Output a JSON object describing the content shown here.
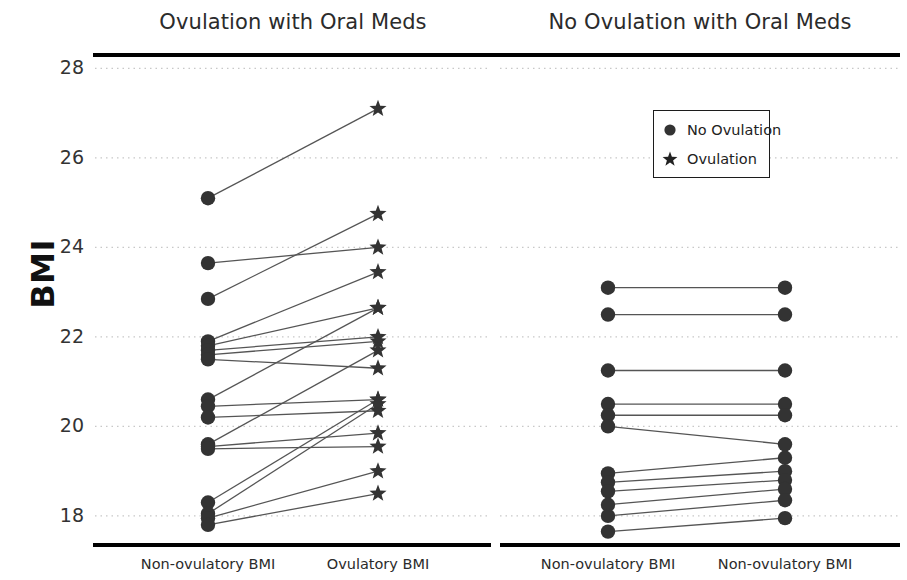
{
  "chart_data": {
    "type": "line",
    "title": "",
    "ylabel": "BMI",
    "xlabel": "",
    "ylim": [
      17.35,
      28.3
    ],
    "yticks": [
      28,
      26,
      24,
      22,
      20,
      18
    ],
    "grid": true,
    "grid_style": "dotted",
    "panels": [
      {
        "title": "Ovulation with Oral Meds",
        "categories": [
          "Non-ovulatory BMI",
          "Ovulatory BMI"
        ],
        "left_marker": "circle",
        "right_marker": "star",
        "pairs": [
          {
            "start": 25.1,
            "end": 27.1
          },
          {
            "start": 23.65,
            "end": 24.0
          },
          {
            "start": 22.85,
            "end": 24.75
          },
          {
            "start": 21.9,
            "end": 23.45
          },
          {
            "start": 21.8,
            "end": 22.65
          },
          {
            "start": 21.7,
            "end": 22.0
          },
          {
            "start": 21.6,
            "end": 21.9
          },
          {
            "start": 21.5,
            "end": 21.3
          },
          {
            "start": 20.6,
            "end": 22.65
          },
          {
            "start": 20.45,
            "end": 20.6
          },
          {
            "start": 20.2,
            "end": 20.35
          },
          {
            "start": 19.6,
            "end": 21.7
          },
          {
            "start": 19.55,
            "end": 19.85
          },
          {
            "start": 19.5,
            "end": 19.55
          },
          {
            "start": 18.3,
            "end": 20.6
          },
          {
            "start": 18.05,
            "end": 20.5
          },
          {
            "start": 17.95,
            "end": 19.0
          },
          {
            "start": 17.8,
            "end": 18.5
          }
        ]
      },
      {
        "title": "No Ovulation with Oral Meds",
        "categories": [
          "Non-ovulatory BMI",
          "Non-ovulatory BMI"
        ],
        "left_marker": "circle",
        "right_marker": "circle",
        "pairs": [
          {
            "start": 23.1,
            "end": 23.1
          },
          {
            "start": 22.5,
            "end": 22.5
          },
          {
            "start": 21.25,
            "end": 21.25
          },
          {
            "start": 20.5,
            "end": 20.5
          },
          {
            "start": 20.25,
            "end": 20.25
          },
          {
            "start": 20.0,
            "end": 19.6
          },
          {
            "start": 18.95,
            "end": 19.3
          },
          {
            "start": 18.75,
            "end": 19.0
          },
          {
            "start": 18.55,
            "end": 18.8
          },
          {
            "start": 18.25,
            "end": 18.6
          },
          {
            "start": 18.0,
            "end": 18.35
          },
          {
            "start": 17.65,
            "end": 17.95
          }
        ]
      }
    ],
    "legend": {
      "position": "upper-right",
      "entries": [
        {
          "label": "No Ovulation",
          "marker": "circle"
        },
        {
          "label": "Ovulation",
          "marker": "star"
        }
      ]
    },
    "colors": {
      "marker": "#333333",
      "line": "#555555",
      "grid": "#c8c8c8",
      "axis": "#000000",
      "text": "#222222"
    }
  }
}
